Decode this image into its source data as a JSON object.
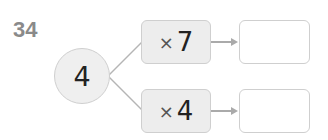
{
  "question_number": "34",
  "start_value": "4",
  "operations": [
    {
      "symbol": "×",
      "operand": "7",
      "answer": ""
    },
    {
      "symbol": "×",
      "operand": "4",
      "answer": ""
    }
  ],
  "colors": {
    "number_label": "#8a8a8a",
    "shape_fill": "#efefef",
    "border": "#cfcfcf",
    "arrow": "#aaaaaa"
  }
}
